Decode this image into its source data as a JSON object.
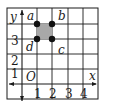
{
  "diagram": {
    "axes": {
      "x_label": "x",
      "y_label": "y",
      "origin_label": "O",
      "x_ticks": [
        "1",
        "2",
        "3",
        "4"
      ],
      "y_ticks": [
        "1",
        "2",
        "3"
      ]
    },
    "grid": {
      "columns": 6,
      "rows": 6,
      "step_px": 15,
      "line_color": "#1a1a1a"
    },
    "square": {
      "fill": "#a8a8a8",
      "vertices": [
        {
          "label": "a",
          "x": 1,
          "y": 4
        },
        {
          "label": "b",
          "x": 2,
          "y": 4
        },
        {
          "label": "c",
          "x": 2,
          "y": 3
        },
        {
          "label": "d",
          "x": 1,
          "y": 3
        }
      ]
    }
  }
}
